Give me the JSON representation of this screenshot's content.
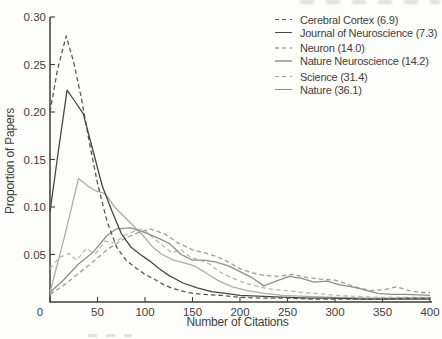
{
  "figure": {
    "background": "#fdfdfb",
    "text_color": "#3f3f3f",
    "axis_color": "#3d3d3d"
  },
  "chart_data": {
    "type": "line",
    "title": "",
    "xlabel": "Number of Citations",
    "ylabel": "Proportion of Papers",
    "xlim": [
      0,
      400
    ],
    "ylim": [
      0,
      0.3
    ],
    "grid": false,
    "legend_position": "top-right",
    "x_ticks": [
      {
        "value": 0,
        "label": "0"
      },
      {
        "value": 50,
        "label": "50"
      },
      {
        "value": 100,
        "label": "100"
      },
      {
        "value": 150,
        "label": "150"
      },
      {
        "value": 200,
        "label": "200"
      },
      {
        "value": 250,
        "label": "250"
      },
      {
        "value": 300,
        "label": "300"
      },
      {
        "value": 350,
        "label": "350"
      },
      {
        "value": 400,
        "label": "400"
      }
    ],
    "y_ticks": [
      {
        "value": 0.05,
        "label": "0.05"
      },
      {
        "value": 0.1,
        "label": "0.10"
      },
      {
        "value": 0.15,
        "label": "0.15"
      },
      {
        "value": 0.2,
        "label": "0.20"
      },
      {
        "value": 0.25,
        "label": "0.25"
      },
      {
        "value": 0.3,
        "label": "0.30"
      }
    ],
    "series": [
      {
        "name": "cerebral-cortex",
        "legend_label": "Cerebral Cortex (6.9)",
        "color": "#585858",
        "dash": true,
        "points": [
          [
            0,
            0.2
          ],
          [
            8,
            0.245
          ],
          [
            17,
            0.28
          ],
          [
            25,
            0.252
          ],
          [
            33,
            0.215
          ],
          [
            42,
            0.165
          ],
          [
            50,
            0.125
          ],
          [
            60,
            0.085
          ],
          [
            70,
            0.058
          ],
          [
            80,
            0.044
          ],
          [
            90,
            0.036
          ],
          [
            100,
            0.029
          ],
          [
            110,
            0.024
          ],
          [
            120,
            0.018
          ],
          [
            130,
            0.014
          ],
          [
            145,
            0.01
          ],
          [
            160,
            0.008
          ],
          [
            180,
            0.007
          ],
          [
            200,
            0.005
          ],
          [
            225,
            0.004
          ],
          [
            250,
            0.004
          ],
          [
            275,
            0.003
          ],
          [
            300,
            0.003
          ],
          [
            325,
            0.003
          ],
          [
            350,
            0.003
          ],
          [
            375,
            0.004
          ],
          [
            400,
            0.004
          ]
        ]
      },
      {
        "name": "journal-of-neuroscience",
        "legend_label": "Journal of Neuroscience (7.3)",
        "color": "#474747",
        "dash": false,
        "points": [
          [
            0,
            0.095
          ],
          [
            9,
            0.16
          ],
          [
            18,
            0.223
          ],
          [
            27,
            0.21
          ],
          [
            35,
            0.198
          ],
          [
            45,
            0.16
          ],
          [
            55,
            0.122
          ],
          [
            65,
            0.096
          ],
          [
            75,
            0.072
          ],
          [
            85,
            0.058
          ],
          [
            95,
            0.05
          ],
          [
            105,
            0.043
          ],
          [
            115,
            0.035
          ],
          [
            125,
            0.028
          ],
          [
            140,
            0.02
          ],
          [
            155,
            0.015
          ],
          [
            170,
            0.011
          ],
          [
            185,
            0.009
          ],
          [
            200,
            0.007
          ],
          [
            225,
            0.006
          ],
          [
            250,
            0.005
          ],
          [
            275,
            0.004
          ],
          [
            300,
            0.004
          ],
          [
            330,
            0.003
          ],
          [
            360,
            0.003
          ],
          [
            400,
            0.003
          ]
        ]
      },
      {
        "name": "neuron",
        "legend_label": "Neuron (14.0)",
        "color": "#b8b8b8",
        "dash": true,
        "points": [
          [
            0,
            0.035
          ],
          [
            10,
            0.047
          ],
          [
            20,
            0.051
          ],
          [
            28,
            0.044
          ],
          [
            38,
            0.056
          ],
          [
            48,
            0.051
          ],
          [
            58,
            0.064
          ],
          [
            68,
            0.062
          ],
          [
            78,
            0.07
          ],
          [
            88,
            0.074
          ],
          [
            98,
            0.077
          ],
          [
            108,
            0.068
          ],
          [
            118,
            0.06
          ],
          [
            128,
            0.052
          ],
          [
            138,
            0.055
          ],
          [
            148,
            0.047
          ],
          [
            158,
            0.044
          ],
          [
            168,
            0.04
          ],
          [
            178,
            0.032
          ],
          [
            190,
            0.026
          ],
          [
            205,
            0.02
          ],
          [
            220,
            0.016
          ],
          [
            235,
            0.013
          ],
          [
            250,
            0.012
          ],
          [
            265,
            0.01
          ],
          [
            280,
            0.009
          ],
          [
            300,
            0.007
          ],
          [
            320,
            0.006
          ],
          [
            345,
            0.005
          ],
          [
            370,
            0.005
          ],
          [
            400,
            0.005
          ]
        ]
      },
      {
        "name": "nature-neuroscience",
        "legend_label": "Nature Neuroscience (14.2)",
        "color": "#adadad",
        "dash": false,
        "points": [
          [
            0,
            0.01
          ],
          [
            15,
            0.068
          ],
          [
            30,
            0.13
          ],
          [
            40,
            0.122
          ],
          [
            48,
            0.117
          ],
          [
            58,
            0.114
          ],
          [
            68,
            0.1
          ],
          [
            78,
            0.09
          ],
          [
            88,
            0.08
          ],
          [
            98,
            0.07
          ],
          [
            108,
            0.058
          ],
          [
            118,
            0.05
          ],
          [
            130,
            0.044
          ],
          [
            142,
            0.041
          ],
          [
            152,
            0.038
          ],
          [
            165,
            0.03
          ],
          [
            178,
            0.022
          ],
          [
            192,
            0.016
          ],
          [
            208,
            0.012
          ],
          [
            225,
            0.009
          ],
          [
            245,
            0.007
          ],
          [
            270,
            0.006
          ],
          [
            300,
            0.005
          ],
          [
            340,
            0.004
          ],
          [
            400,
            0.004
          ]
        ]
      },
      {
        "name": "science",
        "legend_label": "Science (31.4)",
        "color": "#9e9e9e",
        "dash": true,
        "points": [
          [
            0,
            0.008
          ],
          [
            15,
            0.018
          ],
          [
            30,
            0.03
          ],
          [
            45,
            0.042
          ],
          [
            60,
            0.055
          ],
          [
            75,
            0.065
          ],
          [
            90,
            0.072
          ],
          [
            105,
            0.077
          ],
          [
            120,
            0.072
          ],
          [
            135,
            0.062
          ],
          [
            150,
            0.055
          ],
          [
            162,
            0.052
          ],
          [
            175,
            0.048
          ],
          [
            188,
            0.042
          ],
          [
            200,
            0.035
          ],
          [
            212,
            0.031
          ],
          [
            225,
            0.028
          ],
          [
            240,
            0.027
          ],
          [
            255,
            0.029
          ],
          [
            270,
            0.026
          ],
          [
            285,
            0.024
          ],
          [
            300,
            0.023
          ],
          [
            312,
            0.019
          ],
          [
            325,
            0.015
          ],
          [
            338,
            0.012
          ],
          [
            352,
            0.013
          ],
          [
            365,
            0.016
          ],
          [
            378,
            0.012
          ],
          [
            390,
            0.01
          ],
          [
            400,
            0.01
          ]
        ]
      },
      {
        "name": "nature",
        "legend_label": "Nature (36.1)",
        "color": "#8f8f8f",
        "dash": false,
        "points": [
          [
            0,
            0.01
          ],
          [
            15,
            0.024
          ],
          [
            30,
            0.04
          ],
          [
            45,
            0.052
          ],
          [
            60,
            0.07
          ],
          [
            70,
            0.077
          ],
          [
            85,
            0.078
          ],
          [
            100,
            0.073
          ],
          [
            112,
            0.068
          ],
          [
            125,
            0.062
          ],
          [
            138,
            0.05
          ],
          [
            150,
            0.044
          ],
          [
            162,
            0.044
          ],
          [
            175,
            0.042
          ],
          [
            188,
            0.038
          ],
          [
            200,
            0.032
          ],
          [
            212,
            0.026
          ],
          [
            225,
            0.017
          ],
          [
            238,
            0.022
          ],
          [
            252,
            0.027
          ],
          [
            265,
            0.025
          ],
          [
            278,
            0.021
          ],
          [
            292,
            0.022
          ],
          [
            305,
            0.018
          ],
          [
            318,
            0.016
          ],
          [
            330,
            0.013
          ],
          [
            345,
            0.009
          ],
          [
            360,
            0.008
          ],
          [
            375,
            0.008
          ],
          [
            400,
            0.007
          ]
        ]
      }
    ]
  }
}
